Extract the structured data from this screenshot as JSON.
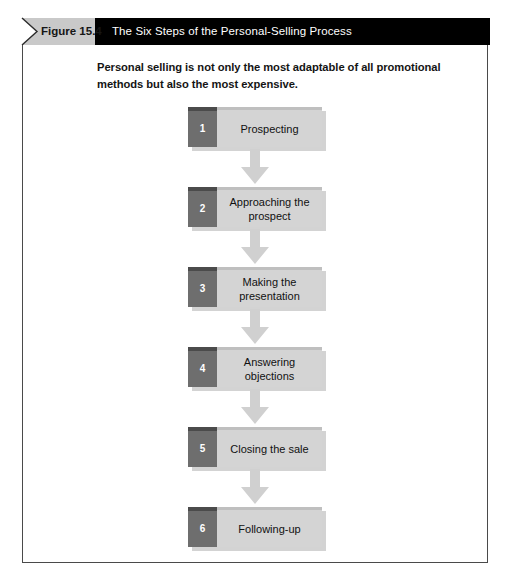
{
  "figure": {
    "tag_label": "Figure 15.4",
    "title": "The Six Steps of the Personal-Selling Process",
    "intro": "Personal selling is not only the most adaptable of all promotional methods but also the most expensive.",
    "bottom_caption": ""
  },
  "colors": {
    "header_bar": "#000000",
    "header_tag": "#c9c9c9",
    "box_fill": "#d4d4d4",
    "number_tab": "#6e6e6e",
    "arrow": "#d0d0d0",
    "border": "#4a4a4a"
  },
  "steps": [
    {
      "number": "1",
      "label": "Prospecting"
    },
    {
      "number": "2",
      "label": "Approaching the prospect"
    },
    {
      "number": "3",
      "label": "Making the presentation"
    },
    {
      "number": "4",
      "label": "Answering objections"
    },
    {
      "number": "5",
      "label": "Closing the sale"
    },
    {
      "number": "6",
      "label": "Following-up"
    }
  ]
}
